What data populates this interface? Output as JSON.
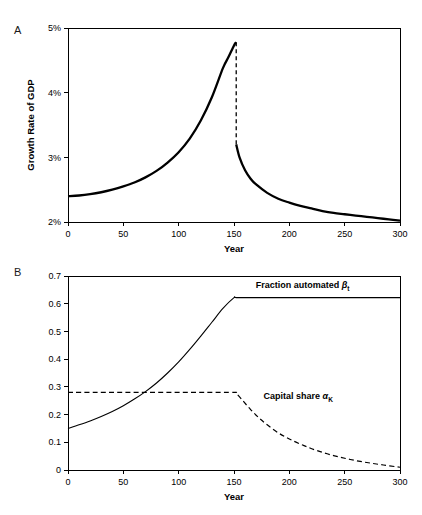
{
  "figure": {
    "panels": [
      {
        "letter": "A"
      },
      {
        "letter": "B"
      }
    ]
  },
  "chart_data": [
    {
      "panel": "A",
      "type": "line",
      "title": "",
      "xlabel": "Year",
      "ylabel": "Growth Rate of GDP",
      "xlim": [
        0,
        300
      ],
      "ylim": [
        2,
        5
      ],
      "xticks": [
        0,
        50,
        100,
        150,
        200,
        250,
        300
      ],
      "xticklabels": [
        "0",
        "50",
        "100",
        "150",
        "200",
        "250",
        "300"
      ],
      "yticks": [
        2,
        3,
        4,
        5
      ],
      "yticklabels": [
        "2%",
        "3%",
        "4%",
        "5%"
      ],
      "grid": false,
      "legend": "none",
      "annotations": [
        "Discontinuous drop at year 152 from 4.78% to 3.20%"
      ],
      "series": [
        {
          "name": "Growth rate before automation completes",
          "style": "solid-thick",
          "x": [
            0,
            10,
            20,
            30,
            40,
            50,
            60,
            70,
            80,
            90,
            100,
            110,
            120,
            130,
            140,
            145,
            150,
            152
          ],
          "y": [
            2.4,
            2.41,
            2.43,
            2.46,
            2.5,
            2.55,
            2.61,
            2.69,
            2.79,
            2.92,
            3.08,
            3.29,
            3.57,
            3.93,
            4.38,
            4.55,
            4.73,
            4.78
          ]
        },
        {
          "name": "Growth rate drop",
          "style": "dashed-drop",
          "x": [
            152,
            152
          ],
          "y": [
            4.78,
            3.2
          ]
        },
        {
          "name": "Growth rate after automation completes",
          "style": "solid-thick",
          "x": [
            152,
            155,
            160,
            165,
            170,
            180,
            190,
            200,
            210,
            220,
            230,
            240,
            250,
            260,
            270,
            280,
            290,
            300
          ],
          "y": [
            3.2,
            3.0,
            2.8,
            2.67,
            2.58,
            2.45,
            2.36,
            2.3,
            2.25,
            2.21,
            2.17,
            2.14,
            2.12,
            2.1,
            2.08,
            2.06,
            2.04,
            2.02
          ]
        }
      ]
    },
    {
      "panel": "B",
      "type": "line",
      "title": "",
      "xlabel": "Year",
      "ylabel": "",
      "xlim": [
        0,
        300
      ],
      "ylim": [
        0,
        0.7
      ],
      "xticks": [
        0,
        50,
        100,
        150,
        200,
        250,
        300
      ],
      "xticklabels": [
        "0",
        "50",
        "100",
        "150",
        "200",
        "250",
        "300"
      ],
      "yticks": [
        0,
        0.1,
        0.2,
        0.3,
        0.4,
        0.5,
        0.6,
        0.7
      ],
      "yticklabels": [
        "0",
        "0.1",
        "0.2",
        "0.3",
        "0.4",
        "0.5",
        "0.6",
        "0.7"
      ],
      "grid": false,
      "legend": "inline-labels",
      "series": [
        {
          "name": "Fraction automated",
          "label_text": "Fraction automated ",
          "label_symbol": "β",
          "label_subscript": "t",
          "label_x": 212,
          "label_y": 0.655,
          "style": "solid-thin",
          "x": [
            0,
            10,
            20,
            30,
            40,
            50,
            60,
            70,
            80,
            90,
            100,
            110,
            120,
            130,
            140,
            150,
            152,
            170,
            200,
            250,
            300
          ],
          "y": [
            0.15,
            0.163,
            0.177,
            0.193,
            0.211,
            0.232,
            0.256,
            0.283,
            0.314,
            0.35,
            0.39,
            0.435,
            0.483,
            0.533,
            0.583,
            0.622,
            0.622,
            0.622,
            0.622,
            0.622,
            0.622
          ]
        },
        {
          "name": "Capital share",
          "label_text": "Capital share ",
          "label_symbol": "α",
          "label_subscript": "K",
          "label_x": 208,
          "label_y": 0.255,
          "style": "dashed-thin",
          "x": [
            0,
            25,
            50,
            75,
            100,
            125,
            150,
            152,
            158,
            165,
            172,
            180,
            190,
            200,
            212,
            225,
            240,
            255,
            270,
            285,
            300
          ],
          "y": [
            0.28,
            0.28,
            0.28,
            0.28,
            0.28,
            0.28,
            0.28,
            0.277,
            0.25,
            0.218,
            0.19,
            0.163,
            0.134,
            0.112,
            0.09,
            0.07,
            0.052,
            0.038,
            0.027,
            0.018,
            0.01
          ]
        }
      ]
    }
  ]
}
